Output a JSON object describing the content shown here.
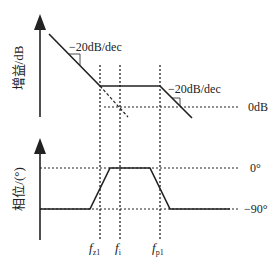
{
  "diagram": {
    "gain_plot": {
      "y_axis_label": "增益/dB",
      "slope_label_left": "−20dB/dec",
      "slope_label_right": "−20dB/dec",
      "reference_label": "0dB"
    },
    "phase_plot": {
      "y_axis_label": "相位/(°)",
      "reference_top_label": "0°",
      "reference_bottom_label": "−90°"
    },
    "frequency_markers": [
      {
        "id": "fz1",
        "label": "f",
        "subscript": "z1"
      },
      {
        "id": "fi",
        "label": "f",
        "subscript": "i"
      },
      {
        "id": "fp1",
        "label": "f",
        "subscript": "p1"
      }
    ],
    "colors": {
      "line": "#222222",
      "background": "#ffffff"
    }
  }
}
